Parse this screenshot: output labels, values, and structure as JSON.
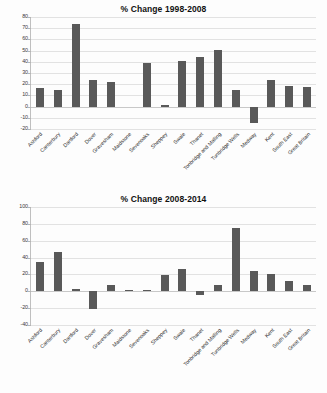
{
  "document": {
    "title": "Housing price percentage change charts"
  },
  "chart_data": [
    {
      "id": "chart-1",
      "type": "bar",
      "title": "% Change 1998-2008",
      "xlabel": "",
      "ylabel": "",
      "ylim": [
        -20,
        80
      ],
      "ytick_step": 10,
      "yticks": [
        80,
        70,
        60,
        50,
        40,
        30,
        20,
        10,
        0,
        -10,
        -20
      ],
      "grid": true,
      "legend": "none",
      "bar_color": "#595959",
      "categories": [
        "Ashford",
        "Canterbury",
        "Dartford",
        "Dover",
        "Gravesham",
        "Maidstone",
        "Sevenoaks",
        "Sheppey",
        "Swale",
        "Thanet",
        "Tonbridge and Malling",
        "Tunbridge Wells",
        "Medway",
        "Kent",
        "South East",
        "Great Britain"
      ],
      "values": [
        16.5,
        14.5,
        74,
        23.5,
        22,
        0,
        38.5,
        1.5,
        41,
        44,
        50.5,
        14.5,
        -15,
        24,
        18.5,
        17.5
      ]
    },
    {
      "id": "chart-2",
      "type": "bar",
      "title": "% Change 2008-2014",
      "xlabel": "",
      "ylabel": "",
      "ylim": [
        -40,
        100
      ],
      "ytick_step": 20,
      "yticks": [
        100,
        80,
        60,
        40,
        20,
        0,
        -20,
        -40
      ],
      "grid": true,
      "legend": "none",
      "bar_color": "#595959",
      "categories": [
        "Ashford",
        "Canterbury",
        "Dartford",
        "Dover",
        "Gravesham",
        "Maidstone",
        "Sevenoaks",
        "Sheppey",
        "Swale",
        "Thanet",
        "Tonbridge and Malling",
        "Tunbridge Wells",
        "Medway",
        "Kent",
        "South East",
        "Great Britain"
      ],
      "values": [
        35,
        47,
        3,
        -21,
        8,
        1.5,
        1.5,
        19,
        27,
        -5,
        7.5,
        75,
        23.5,
        21,
        12,
        8
      ]
    }
  ]
}
